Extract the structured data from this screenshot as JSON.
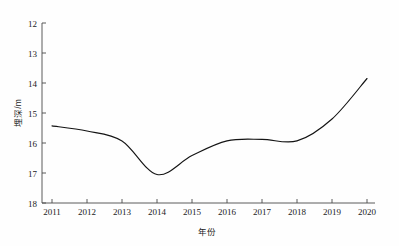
{
  "chart_data": {
    "type": "line",
    "title": "",
    "xlabel": "年份",
    "ylabel": "埋深/m",
    "x": [
      2011,
      2012,
      2013,
      2014,
      2015,
      2016,
      2017,
      2018,
      2019,
      2020
    ],
    "values": [
      15.43,
      15.6,
      15.93,
      17.05,
      16.42,
      15.93,
      15.88,
      15.93,
      15.2,
      13.85
    ],
    "series": [
      {
        "name": "埋深",
        "values": [
          15.43,
          15.6,
          15.93,
          17.05,
          16.42,
          15.93,
          15.88,
          15.93,
          15.2,
          13.85
        ]
      }
    ],
    "xticks": [
      "2011",
      "2012",
      "2013",
      "2014",
      "2015",
      "2016",
      "2017",
      "2018",
      "2019",
      "2020"
    ],
    "yticks": [
      "12",
      "13",
      "14",
      "15",
      "16",
      "17",
      "18"
    ],
    "ytick_values": [
      12,
      13,
      14,
      15,
      16,
      17,
      18
    ],
    "xlim": [
      2011,
      2020
    ],
    "ylim": [
      12,
      18
    ],
    "y_axis_inverted": true,
    "grid": false,
    "legend": false,
    "legend_position": "none",
    "line_color": "#141414",
    "background_color": "#fefefe",
    "axis_color": "#4a4a4a"
  },
  "axes": {
    "x_title": "年份",
    "y_title": "埋深/m"
  }
}
